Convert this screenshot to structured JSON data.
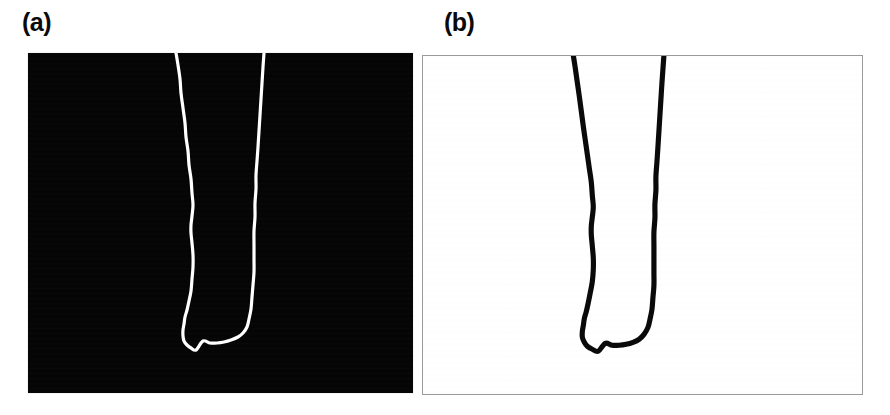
{
  "figure": {
    "width": 890,
    "height": 415,
    "background_color": "#ffffff",
    "layout": "two-panel-side-by-side",
    "caption_labels": [
      "(a)",
      "(b)"
    ]
  },
  "panels": [
    {
      "id": "a",
      "label": "(a)",
      "label_position": {
        "x": 22,
        "y": 10
      },
      "frame": {
        "x": 28,
        "y": 53,
        "width": 385,
        "height": 340
      },
      "background_color": "#050505",
      "border_color": "#e9e9e9",
      "curve_color": "#ffffff",
      "curve_stroke_width": 3.2,
      "rendering": "white-curve-on-black",
      "description": "U-shaped filament silhouette rendered bright on dark background"
    },
    {
      "id": "b",
      "label": "(b)",
      "label_position": {
        "x": 444,
        "y": 10
      },
      "frame": {
        "x": 422,
        "y": 55,
        "width": 441,
        "height": 340
      },
      "background_color": "#ffffff",
      "border_color": "#9a9a9a",
      "curve_color": "#0a0a0a",
      "curve_stroke_width": 5.2,
      "rendering": "black-curve-on-white",
      "description": "Binarized / tone-inverted counterpart of panel (a), same U-shaped filament"
    }
  ],
  "chart_data": {
    "type": "line",
    "title": "",
    "subtitle": "",
    "xlabel": "",
    "ylabel": "",
    "grid": false,
    "legend": "none",
    "note": "Traced outline of a hairpin / U-shaped filament. Coordinates are in each panel's local pixel space (origin at panel top-left). The path is open at the top edge of each panel: it enters at the left branch, descends, sweeps around the rounded bottom, and exits at the right branch.",
    "series": [
      {
        "name": "filament-outline-panel-a",
        "panel": "a",
        "axis_range_x": [
          0,
          385
        ],
        "axis_range_y": [
          0,
          340
        ],
        "points": [
          [
            148,
            0
          ],
          [
            150,
            12
          ],
          [
            152,
            26
          ],
          [
            153,
            40
          ],
          [
            155,
            55
          ],
          [
            157,
            70
          ],
          [
            158,
            84
          ],
          [
            160,
            98
          ],
          [
            161,
            112
          ],
          [
            163,
            126
          ],
          [
            164,
            140
          ],
          [
            165,
            152
          ],
          [
            164,
            163
          ],
          [
            163,
            172
          ],
          [
            163,
            180
          ],
          [
            164,
            190
          ],
          [
            165,
            202
          ],
          [
            165,
            214
          ],
          [
            164,
            226
          ],
          [
            163,
            238
          ],
          [
            161,
            248
          ],
          [
            159,
            257
          ],
          [
            157,
            264
          ],
          [
            156,
            271
          ],
          [
            155,
            277
          ],
          [
            155,
            283
          ],
          [
            156,
            288
          ],
          [
            159,
            292
          ],
          [
            163,
            295
          ],
          [
            168,
            297
          ],
          [
            175,
            288
          ],
          [
            182,
            290
          ],
          [
            189,
            290
          ],
          [
            196,
            289
          ],
          [
            203,
            287
          ],
          [
            210,
            284
          ],
          [
            215,
            280
          ],
          [
            219,
            274
          ],
          [
            221,
            266
          ],
          [
            223,
            256
          ],
          [
            224,
            244
          ],
          [
            225,
            232
          ],
          [
            226,
            219
          ],
          [
            226,
            206
          ],
          [
            226,
            192
          ],
          [
            226,
            178
          ],
          [
            227,
            164
          ],
          [
            227,
            150
          ],
          [
            228,
            136
          ],
          [
            228,
            122
          ],
          [
            229,
            108
          ],
          [
            230,
            94
          ],
          [
            231,
            78
          ],
          [
            232,
            62
          ],
          [
            233,
            46
          ],
          [
            234,
            30
          ],
          [
            235,
            14
          ],
          [
            236,
            0
          ]
        ]
      },
      {
        "name": "filament-outline-panel-b",
        "panel": "b",
        "axis_range_x": [
          0,
          441
        ],
        "axis_range_y": [
          0,
          340
        ],
        "points": [
          [
            151,
            0
          ],
          [
            153,
            13
          ],
          [
            155,
            27
          ],
          [
            157,
            41
          ],
          [
            159,
            56
          ],
          [
            161,
            71
          ],
          [
            163,
            85
          ],
          [
            165,
            99
          ],
          [
            167,
            113
          ],
          [
            169,
            127
          ],
          [
            170,
            140
          ],
          [
            171,
            152
          ],
          [
            170,
            162
          ],
          [
            169,
            171
          ],
          [
            169,
            180
          ],
          [
            170,
            191
          ],
          [
            171,
            203
          ],
          [
            171,
            215
          ],
          [
            170,
            227
          ],
          [
            168,
            238
          ],
          [
            166,
            248
          ],
          [
            164,
            257
          ],
          [
            162,
            264
          ],
          [
            161,
            271
          ],
          [
            160,
            277
          ],
          [
            160,
            283
          ],
          [
            162,
            288
          ],
          [
            165,
            292
          ],
          [
            170,
            295
          ],
          [
            176,
            297
          ],
          [
            183,
            289
          ],
          [
            190,
            291
          ],
          [
            197,
            291
          ],
          [
            204,
            290
          ],
          [
            211,
            288
          ],
          [
            217,
            285
          ],
          [
            222,
            280
          ],
          [
            226,
            273
          ],
          [
            228,
            265
          ],
          [
            230,
            255
          ],
          [
            231,
            243
          ],
          [
            232,
            231
          ],
          [
            232,
            218
          ],
          [
            232,
            205
          ],
          [
            232,
            191
          ],
          [
            232,
            177
          ],
          [
            233,
            163
          ],
          [
            233,
            149
          ],
          [
            234,
            135
          ],
          [
            234,
            121
          ],
          [
            235,
            107
          ],
          [
            236,
            92
          ],
          [
            237,
            76
          ],
          [
            238,
            60
          ],
          [
            239,
            44
          ],
          [
            240,
            28
          ],
          [
            241,
            14
          ],
          [
            242,
            0
          ]
        ]
      }
    ]
  }
}
